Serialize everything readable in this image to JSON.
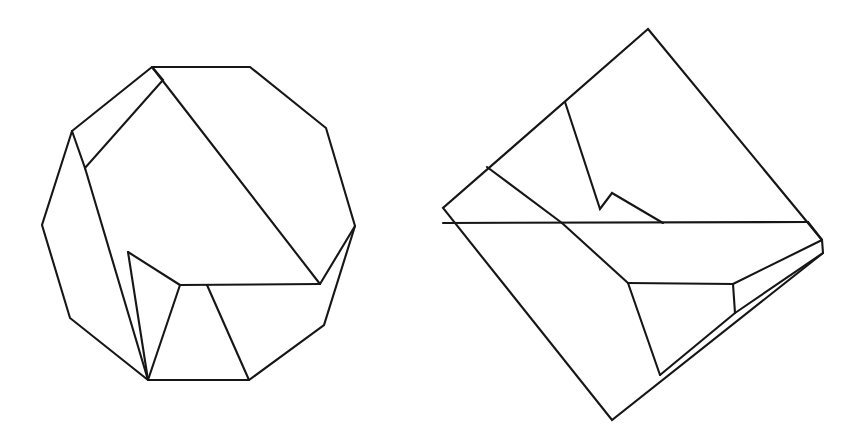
{
  "page": {
    "background_color": "#ffffff",
    "stroke_color": "#161616",
    "stroke_width": 2.1,
    "width": 865,
    "height": 441,
    "caption": ""
  },
  "figures": [
    {
      "id": "left-figure",
      "name": "decagon-dissection",
      "label": "",
      "outline": {
        "name": "decagon-outline",
        "points": "152,67 250,67 326,128 355,226 324,325 249,380 148,380 70,318 42,225 72,131"
      },
      "cuts": [
        {
          "name": "cut-long-diagonal",
          "points": "152,67 320,284"
        },
        {
          "name": "cut-upper-left-strip",
          "points": "152,67 163,80 85,168 72,131"
        },
        {
          "name": "cut-left-panel-edge",
          "points": "85,168 148,380"
        },
        {
          "name": "cut-notch-left",
          "points": "128,252 180,285"
        },
        {
          "name": "cut-notch-down",
          "points": "128,252 148,380"
        },
        {
          "name": "cut-base-horizontal",
          "points": "180,285 320,284"
        },
        {
          "name": "cut-right-wedge",
          "points": "320,284 355,226"
        },
        {
          "name": "cut-lower-left-diagonal",
          "points": "180,285 148,380"
        },
        {
          "name": "cut-lower-right-diagonal",
          "points": "207,285 249,380"
        }
      ]
    },
    {
      "id": "right-figure",
      "name": "square-dissection",
      "label": "",
      "outline": {
        "name": "rotated-square-outline",
        "points": "648,29 822,240 823,253 612,420 443,208"
      },
      "cuts": [
        {
          "name": "cut-main-horizontal",
          "points": "443,223 808,222"
        },
        {
          "name": "cut-zigzag-descent",
          "points": "565,102 600,209 612,193 663,223"
        },
        {
          "name": "cut-upper-left-slope",
          "points": "487,167 562,223"
        },
        {
          "name": "cut-lower-left-slope",
          "points": "562,223 628,283"
        },
        {
          "name": "cut-lower-horizontal",
          "points": "628,283 733,284"
        },
        {
          "name": "cut-lower-diagonal",
          "points": "628,283 660,375"
        },
        {
          "name": "cut-bottom-right-edge",
          "points": "660,375 735,313"
        },
        {
          "name": "cut-right-strip-top",
          "points": "733,284 822,240"
        },
        {
          "name": "cut-right-strip-bottom",
          "points": "735,313 823,253"
        },
        {
          "name": "cut-right-strip-end",
          "points": "733,284 735,313"
        },
        {
          "name": "cut-right-corner-fold",
          "points": "808,222 822,240"
        }
      ]
    }
  ]
}
